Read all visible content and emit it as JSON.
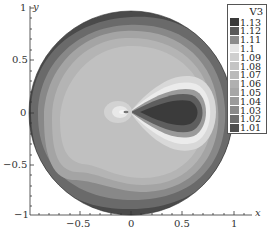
{
  "chart_data": {
    "type": "heatmap",
    "subtype": "filled-contour-on-unit-disk",
    "title": "",
    "xlabel": "x",
    "ylabel": "y",
    "xlim": [
      -1,
      1.2
    ],
    "ylim": [
      -1,
      1
    ],
    "x_ticks": [
      -0.5,
      0,
      0.5,
      1
    ],
    "x_tick_labels": [
      "−0.5",
      "0",
      "0.5",
      "1"
    ],
    "y_ticks": [
      -1,
      -0.5,
      0,
      0.5,
      1
    ],
    "y_tick_labels": [
      "−1",
      "−0.5",
      "0",
      "0.5",
      "1"
    ],
    "grid": false,
    "colorbar": {
      "title": "V3",
      "position": "upper-right",
      "levels": [
        1.13,
        1.12,
        1.11,
        1.1,
        1.09,
        1.08,
        1.07,
        1.06,
        1.05,
        1.04,
        1.03,
        1.02,
        1.01
      ],
      "level_labels": [
        "1.13",
        "1.12",
        "1.11",
        "1.1",
        "1.09",
        "1.08",
        "1.07",
        "1.06",
        "1.05",
        "1.04",
        "1.03",
        "1.02",
        "1.01"
      ],
      "colors": [
        "#3a3a3a",
        "#595959",
        "#8c8c8c",
        "#e6e6e6",
        "#cfcfcf",
        "#c4c4c4",
        "#bababa",
        "#b0b0b0",
        "#a6a6a6",
        "#9a9a9a",
        "#8a8a8a",
        "#6e6e6e",
        "#4f4f4f"
      ]
    },
    "features": [
      "Outer boundary ring near unit circle has lowest values (~1.01-1.03, dark gray)",
      "Broad interior plateau ~1.06-1.08 (light gray)",
      "Teardrop-shaped maximum region centered near (0.4, 0) reaching ~1.13 (darkest)",
      "Small bright region / singular point near origin (~(0,0)) with value ~1.1",
      "Bright halo (~1.1) surrounding the teardrop"
    ],
    "domain": "unit disk centered at (0,0)"
  },
  "caption": "图"
}
